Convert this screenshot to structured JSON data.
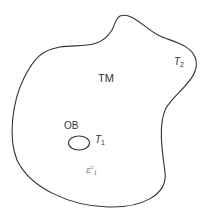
{
  "diagram": {
    "colors": {
      "stroke": "#333333",
      "text": "#333333",
      "faint_text": "#777777",
      "background": "#ffffff"
    },
    "regions": [
      {
        "id": "outer-region",
        "label": "TM",
        "boundary_label": "T",
        "boundary_subscript": "2"
      },
      {
        "id": "inner-region",
        "label": "OB",
        "boundary_label": "T",
        "boundary_subscript": "1"
      }
    ],
    "labels": {
      "tm": "TM",
      "ob": "OB",
      "t1_main": "T",
      "t1_sub": "1",
      "t2_main": "T",
      "t2_sub": "2",
      "epsilon_main": "ε",
      "epsilon_sup": "c",
      "epsilon_sub": "i"
    }
  }
}
